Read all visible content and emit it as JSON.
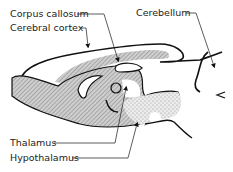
{
  "diagram": {
    "labels": {
      "corpus_callosum": "Corpus callosum",
      "cerebral_cortex": "Cerebral cortex",
      "cerebellum": "Cerebellum",
      "thalamus": "Thalamus",
      "hypothalamus": "Hypothalamus"
    },
    "colors": {
      "outline": "#111111",
      "hatch": "#9a9a9a",
      "stipple": "#a8a8a8",
      "text": "#222222"
    }
  }
}
